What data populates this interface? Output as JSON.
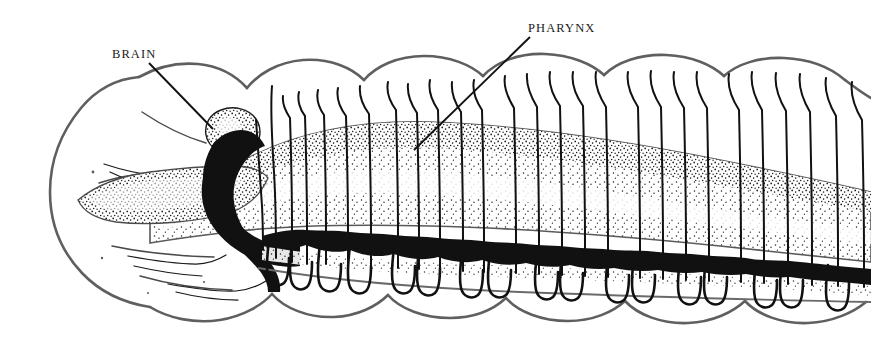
{
  "figure": {
    "background_color": "#ffffff",
    "ink_color": "#1a1a1a",
    "outline_color": "#5a5a5a",
    "width": 871,
    "height": 354
  },
  "labels": [
    {
      "id": "brain",
      "text": "BRAIN",
      "x": 112,
      "y": 58,
      "leader": {
        "x1": 149,
        "y1": 63,
        "x2": 213,
        "y2": 129
      }
    },
    {
      "id": "pharynx",
      "text": "PHARYNX",
      "x": 528,
      "y": 32,
      "leader": {
        "x1": 530,
        "y1": 37,
        "x2": 414,
        "y2": 150
      }
    }
  ],
  "structures": [
    {
      "id": "body-wall",
      "name": "segmented body wall",
      "style": "grey outline, white fill"
    },
    {
      "id": "pharynx-mass",
      "name": "pharynx",
      "style": "stippled wedge"
    },
    {
      "id": "brain-ganglion",
      "name": "suprapharyngeal ganglion (brain)",
      "style": "stippled lobe"
    },
    {
      "id": "subpharyngeal-ganglion",
      "name": "subpharyngeal ganglion",
      "style": "solid black"
    },
    {
      "id": "ventral-nerve-cord",
      "name": "ventral nerve cord with segmental ganglia",
      "style": "solid black chain"
    },
    {
      "id": "segmental-nerves",
      "name": "segmental nerves",
      "style": "fine black lines"
    },
    {
      "id": "nerve-loops",
      "name": "ventral nerve loops",
      "style": "black U-shaped loops"
    }
  ],
  "counts": {
    "segmental_nerve_pairs": 19,
    "ventral_ganglia": 17,
    "nerve_loops": 17
  }
}
